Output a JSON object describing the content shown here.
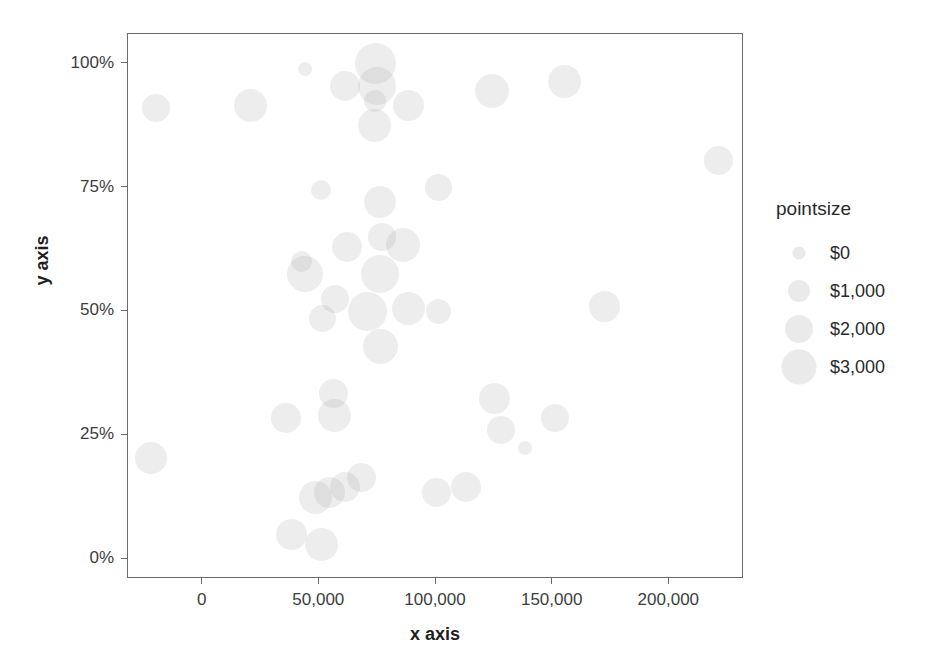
{
  "chart_data": {
    "type": "scatter",
    "title": "",
    "xlabel": "x axis",
    "ylabel": "y axis",
    "xlim": [
      -32000,
      232000
    ],
    "ylim": [
      -0.04,
      1.06
    ],
    "grid": false,
    "size_encoding": "pointsize",
    "x_ticks": [
      0,
      50000,
      100000,
      150000,
      200000
    ],
    "x_tick_labels": [
      "0",
      "50,000",
      "100,000",
      "150,000",
      "200,000"
    ],
    "y_ticks": [
      0,
      0.25,
      0.5,
      0.75,
      1.0
    ],
    "y_tick_labels": [
      "0%",
      "25%",
      "50%",
      "75%",
      "100%"
    ],
    "legend": {
      "position": "right",
      "title": "pointsize",
      "entries": [
        {
          "label": "$0",
          "value": 0,
          "marker_px": 13
        },
        {
          "label": "$1,000",
          "value": 1000,
          "marker_px": 22
        },
        {
          "label": "$2,000",
          "value": 2000,
          "marker_px": 28
        },
        {
          "label": "$3,000",
          "value": 3000,
          "marker_px": 35
        }
      ]
    },
    "points": [
      {
        "x": -20000,
        "y": 0.91,
        "size": 1300,
        "px": 28
      },
      {
        "x": 20500,
        "y": 0.915,
        "size": 1900,
        "px": 33
      },
      {
        "x": 44000,
        "y": 0.99,
        "size": 300,
        "px": 14
      },
      {
        "x": 61000,
        "y": 0.955,
        "size": 1600,
        "px": 30
      },
      {
        "x": 74000,
        "y": 1.0,
        "size": 2900,
        "px": 41
      },
      {
        "x": 74500,
        "y": 0.955,
        "size": 2600,
        "px": 38
      },
      {
        "x": 74000,
        "y": 0.925,
        "size": 900,
        "px": 22
      },
      {
        "x": 73500,
        "y": 0.875,
        "size": 1900,
        "px": 33
      },
      {
        "x": 88000,
        "y": 0.915,
        "size": 1700,
        "px": 31
      },
      {
        "x": 124000,
        "y": 0.945,
        "size": 2000,
        "px": 34
      },
      {
        "x": 155000,
        "y": 0.965,
        "size": 1900,
        "px": 33
      },
      {
        "x": 221000,
        "y": 0.805,
        "size": 1400,
        "px": 29
      },
      {
        "x": 50500,
        "y": 0.745,
        "size": 700,
        "px": 20
      },
      {
        "x": 76000,
        "y": 0.72,
        "size": 1800,
        "px": 32
      },
      {
        "x": 101000,
        "y": 0.75,
        "size": 1200,
        "px": 27
      },
      {
        "x": 62000,
        "y": 0.63,
        "size": 1500,
        "px": 30
      },
      {
        "x": 77000,
        "y": 0.65,
        "size": 1300,
        "px": 28
      },
      {
        "x": 86000,
        "y": 0.635,
        "size": 2000,
        "px": 34
      },
      {
        "x": 44000,
        "y": 0.575,
        "size": 2300,
        "px": 36
      },
      {
        "x": 42500,
        "y": 0.6,
        "size": 800,
        "px": 21
      },
      {
        "x": 76000,
        "y": 0.575,
        "size": 2500,
        "px": 38
      },
      {
        "x": 56500,
        "y": 0.525,
        "size": 1300,
        "px": 28
      },
      {
        "x": 51500,
        "y": 0.485,
        "size": 1200,
        "px": 27
      },
      {
        "x": 70500,
        "y": 0.5,
        "size": 2600,
        "px": 39
      },
      {
        "x": 88000,
        "y": 0.505,
        "size": 1900,
        "px": 33
      },
      {
        "x": 101000,
        "y": 0.5,
        "size": 1100,
        "px": 25
      },
      {
        "x": 172000,
        "y": 0.51,
        "size": 1700,
        "px": 31
      },
      {
        "x": 76000,
        "y": 0.43,
        "size": 2200,
        "px": 35
      },
      {
        "x": 35500,
        "y": 0.285,
        "size": 1500,
        "px": 30
      },
      {
        "x": 56000,
        "y": 0.335,
        "size": 1400,
        "px": 29
      },
      {
        "x": 56500,
        "y": 0.29,
        "size": 1900,
        "px": 33
      },
      {
        "x": 125000,
        "y": 0.325,
        "size": 1700,
        "px": 31
      },
      {
        "x": -22000,
        "y": 0.205,
        "size": 1800,
        "px": 32
      },
      {
        "x": 128000,
        "y": 0.26,
        "size": 1300,
        "px": 28
      },
      {
        "x": 151000,
        "y": 0.285,
        "size": 1300,
        "px": 28
      },
      {
        "x": 138000,
        "y": 0.225,
        "size": 300,
        "px": 14
      },
      {
        "x": 68000,
        "y": 0.165,
        "size": 1400,
        "px": 29
      },
      {
        "x": 61000,
        "y": 0.145,
        "size": 1600,
        "px": 30
      },
      {
        "x": 54500,
        "y": 0.135,
        "size": 1700,
        "px": 31
      },
      {
        "x": 48500,
        "y": 0.125,
        "size": 1900,
        "px": 33
      },
      {
        "x": 100000,
        "y": 0.135,
        "size": 1400,
        "px": 29
      },
      {
        "x": 113000,
        "y": 0.145,
        "size": 1500,
        "px": 30
      },
      {
        "x": 38000,
        "y": 0.05,
        "size": 1700,
        "px": 31
      },
      {
        "x": 51000,
        "y": 0.03,
        "size": 1900,
        "px": 33
      }
    ]
  }
}
